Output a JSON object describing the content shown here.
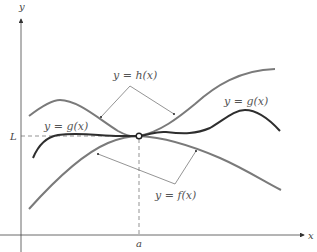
{
  "diagram": {
    "axes": {
      "x_label": "x",
      "y_label": "y",
      "x_marker": "a",
      "y_marker": "L"
    },
    "curves": [
      {
        "id": "h",
        "label": "y = h(x)",
        "role": "upper bound",
        "color": "#7a7a7a"
      },
      {
        "id": "g",
        "label": "y = g(x)",
        "role": "squeezed function",
        "color": "#2e2e2e"
      },
      {
        "id": "f",
        "label": "y = f(x)",
        "role": "lower bound",
        "color": "#7a7a7a"
      }
    ],
    "labels": {
      "h_label": "y = h(x)",
      "g_label_left": "y = g(x)",
      "g_label_right": "y = g(x)",
      "f_label": "y = f(x)"
    },
    "point": {
      "description": "open circle at (a, L)"
    },
    "colors": {
      "axis": "#444444",
      "guide": "#666666",
      "bound_curves": "#7a7a7a",
      "g_curve": "#2e2e2e",
      "leader_lines": "#666666"
    }
  }
}
